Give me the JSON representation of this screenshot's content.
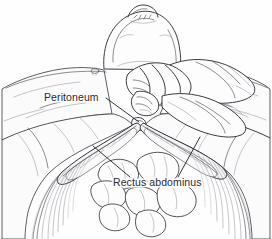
{
  "figure": {
    "kind": "medical-line-illustration",
    "view": "patient supine, viewed from the feet",
    "background_color": "#fefefe",
    "ink_color": "#3b3b42",
    "label_color": "#2a2a30"
  },
  "labels": {
    "peritoneum": {
      "text": "Peritoneum",
      "x": 44,
      "y": 101,
      "leader_from": [
        106,
        98
      ],
      "leader_to": [
        139,
        122
      ]
    },
    "rectus_abdominus": {
      "text": "Rectus abdominus",
      "x": 113,
      "y": 186,
      "leader_left_from": [
        130,
        177
      ],
      "leader_left_to": [
        93,
        146
      ],
      "leader_right_from": [
        178,
        177
      ],
      "leader_right_to": [
        200,
        137
      ]
    }
  },
  "anatomy": {
    "head": "patient head and chin, top center",
    "chest": "chest wall with nipple marking left of center",
    "hands": "surgeon's gloved hands and fingers gripping wound edges at center",
    "incision": "transverse abdominal incision opening downward",
    "muscle_bands": "two rectus abdominus muscle bellies shown as hatched bands flanking the midline",
    "fascia": "fanning aponeurosis fibers sweeping to lower left and lower right",
    "bowel": "loops of bowel visible through the opened peritoneum at lower center"
  }
}
